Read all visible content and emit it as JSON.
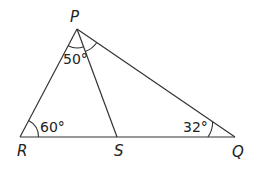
{
  "diagram": {
    "type": "triangle",
    "vertices": {
      "P": {
        "label": "P"
      },
      "Q": {
        "label": "Q"
      },
      "R": {
        "label": "R"
      },
      "S": {
        "label": "S"
      }
    },
    "segments": [
      "PR",
      "PS",
      "PQ",
      "RS",
      "SQ"
    ],
    "angles": {
      "R": {
        "vertex": "R",
        "label": "60°"
      },
      "Q": {
        "vertex": "Q",
        "label": "32°"
      },
      "RPS": {
        "vertex": "P",
        "label": "50°"
      },
      "SPQ": {
        "vertex": "P",
        "label": ""
      }
    }
  }
}
